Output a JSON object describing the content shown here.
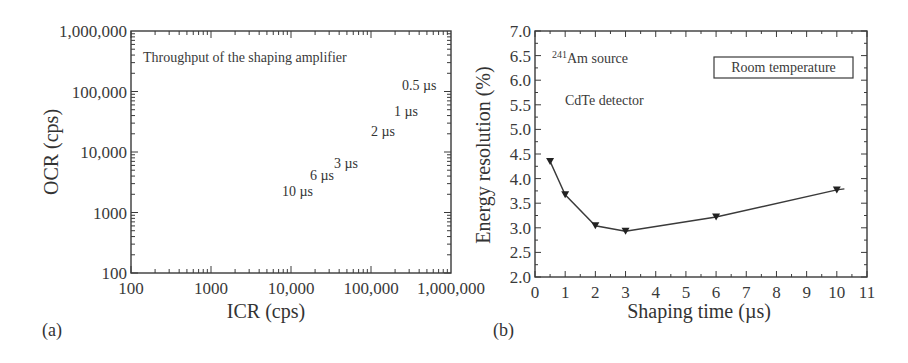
{
  "panels": {
    "a": {
      "label": "(a)"
    },
    "b": {
      "label": "(b)"
    }
  },
  "chart_data": [
    {
      "type": "line",
      "panel": "(a)",
      "title": "Throughput of the shaping amplifier",
      "xlabel": "ICR (cps)",
      "ylabel": "OCR (cps)",
      "xscale": "log",
      "yscale": "log",
      "xlim": [
        100,
        1000000
      ],
      "ylim": [
        100,
        1000000
      ],
      "xticks": [
        "100",
        "1000",
        "10,000",
        "100,000",
        "1,000,000"
      ],
      "yticks": [
        "100",
        "1000",
        "10,000",
        "100,000",
        "1,000,000"
      ],
      "grid": false,
      "series": [
        {
          "name": "0.5 µs",
          "shaping_time_us": 0.5,
          "peak_icr": 210000,
          "peak_ocr": 76000,
          "dead_time_us": 4.84
        },
        {
          "name": "1 µs",
          "shaping_time_us": 1,
          "peak_icr": 120000,
          "peak_ocr": 36000,
          "dead_time_us": 10.2
        },
        {
          "name": "2 µs",
          "shaping_time_us": 2,
          "peak_icr": 63000,
          "peak_ocr": 20000,
          "dead_time_us": 18.4
        },
        {
          "name": "3 µs",
          "shaping_time_us": 3,
          "peak_icr": 38000,
          "peak_ocr": 13000,
          "dead_time_us": 28.3
        },
        {
          "name": "6 µs",
          "shaping_time_us": 6,
          "peak_icr": 20000,
          "peak_ocr": 6600,
          "dead_time_us": 55.7
        },
        {
          "name": "10 µs",
          "shaping_time_us": 10,
          "peak_icr": 11000,
          "peak_ocr": 3900,
          "dead_time_us": 94.3
        }
      ]
    },
    {
      "type": "line",
      "panel": "(b)",
      "title": "",
      "xlabel": "Shaping time (µs)",
      "ylabel": "Energy resolution (%)",
      "xlim": [
        0,
        11
      ],
      "ylim": [
        2.0,
        7.0
      ],
      "xticks": [
        "0",
        "1",
        "2",
        "3",
        "4",
        "5",
        "6",
        "7",
        "8",
        "9",
        "10",
        "11"
      ],
      "yticks": [
        "2.0",
        "2.5",
        "3.0",
        "3.5",
        "4.0",
        "4.5",
        "5.0",
        "5.5",
        "6.0",
        "6.5",
        "7.0"
      ],
      "grid": false,
      "marker": "triangle-down",
      "annotations": {
        "source_prefix": "241",
        "source_text": "Am source",
        "detector": "CdTe detector",
        "legend_box": "Room temperature"
      },
      "x": [
        0.5,
        1,
        2,
        3,
        6,
        10
      ],
      "values": [
        4.35,
        3.67,
        3.04,
        2.93,
        3.22,
        3.77
      ]
    }
  ]
}
